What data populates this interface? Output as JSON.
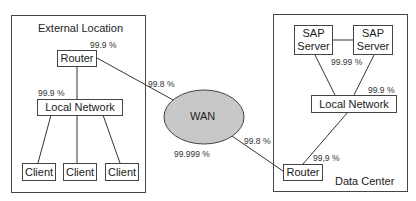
{
  "diagram": {
    "external_location": {
      "title": "External Location",
      "router": "Router",
      "local_network": "Local Network",
      "clients": [
        "Client",
        "Client",
        "Client"
      ],
      "router_availability": "99.9 %",
      "local_network_availability": "99.9 %"
    },
    "wan": {
      "label": "WAN",
      "availability": "99.999 %",
      "fill_color": "#c8c8c8",
      "link_external_availability": "99.8 %",
      "link_datacenter_availability": "99.8 %"
    },
    "data_center": {
      "title": "Data Center",
      "servers": [
        "SAP\nServer",
        "SAP\nServer"
      ],
      "server_line1": "SAP",
      "server_line2": "Server",
      "local_network": "Local Network",
      "router": "Router",
      "servers_availability": "99.99 %",
      "local_network_availability": "99.9 %",
      "router_availability": "99,9 %"
    }
  }
}
